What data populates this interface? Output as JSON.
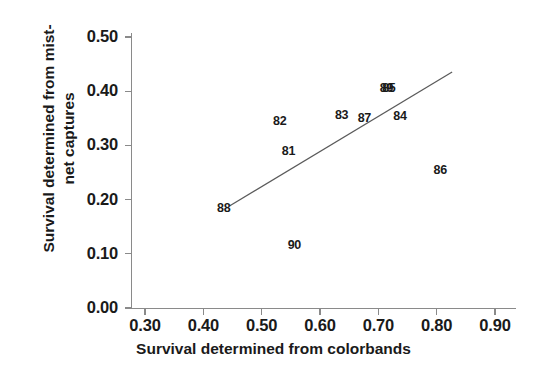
{
  "chart_data": {
    "type": "scatter",
    "title": "",
    "xlabel": "Survival determined from colorbands",
    "ylabel": "Survival determined from mist-net captures",
    "xlim": [
      0.28,
      0.92
    ],
    "ylim": [
      0.0,
      0.52
    ],
    "xticks": [
      "0.30",
      "0.40",
      "0.50",
      "0.60",
      "0.70",
      "0.80",
      "0.90"
    ],
    "xtick_values": [
      0.3,
      0.4,
      0.5,
      0.6,
      0.7,
      0.8,
      0.9
    ],
    "yticks": [
      "0.00",
      "0.10",
      "0.20",
      "0.30",
      "0.40",
      "0.50"
    ],
    "ytick_values": [
      0.0,
      0.1,
      0.2,
      0.3,
      0.4,
      0.5
    ],
    "grid": false,
    "legend": false,
    "marker_style": "text-label",
    "points": [
      {
        "label": "88",
        "x": 0.435,
        "y": 0.185
      },
      {
        "label": "90",
        "x": 0.556,
        "y": 0.116
      },
      {
        "label": "82",
        "x": 0.531,
        "y": 0.345
      },
      {
        "label": "81",
        "x": 0.546,
        "y": 0.29
      },
      {
        "label": "83",
        "x": 0.637,
        "y": 0.356
      },
      {
        "label": "87",
        "x": 0.676,
        "y": 0.35
      },
      {
        "label": "89",
        "x": 0.714,
        "y": 0.406
      },
      {
        "label": "85",
        "x": 0.718,
        "y": 0.406
      },
      {
        "label": "84",
        "x": 0.737,
        "y": 0.355
      },
      {
        "label": "86",
        "x": 0.806,
        "y": 0.254
      }
    ],
    "trendline": {
      "type": "linear",
      "x_start": 0.4455,
      "y_start": 0.1885,
      "x_end": 0.8265,
      "y_end": 0.4355
    },
    "colors": {
      "axis": "#8a8a8a",
      "text": "#1a1a1a",
      "line": "#5a5a5a",
      "background": "#ffffff"
    }
  }
}
